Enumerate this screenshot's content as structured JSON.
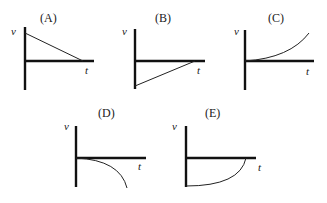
{
  "figure": {
    "axis_labels": {
      "vertical": "v",
      "horizontal": "t"
    },
    "graphs": [
      {
        "id": "A",
        "label": "(A)",
        "shape": "straight line decreasing from positive v to zero at end of t axis"
      },
      {
        "id": "B",
        "label": "(B)",
        "shape": "straight line increasing from negative v to zero"
      },
      {
        "id": "C",
        "label": "(C)",
        "shape": "curve starting at zero, increasing upward with growing slope"
      },
      {
        "id": "D",
        "label": "(D)",
        "shape": "curve starting at zero, decreasing downward with growing slope"
      },
      {
        "id": "E",
        "label": "(E)",
        "shape": "curve starting at negative v, rising to zero with growing slope"
      }
    ]
  }
}
